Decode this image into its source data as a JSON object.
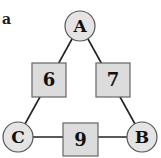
{
  "panel_label": "a",
  "colors": {
    "node_fill": "#e4e4e4",
    "node_stroke": "#555555",
    "box_fill": "#dcdcdc",
    "box_stroke": "#666666",
    "edge": "#222222",
    "text": "#111111"
  },
  "nodes": [
    {
      "id": "A",
      "label": "A",
      "cx": 80,
      "cy": 26,
      "r": 15
    },
    {
      "id": "B",
      "label": "B",
      "cx": 142,
      "cy": 137,
      "r": 15
    },
    {
      "id": "C",
      "label": "C",
      "cx": 18,
      "cy": 137,
      "r": 15
    }
  ],
  "edges": [
    {
      "from": "A",
      "to": "C",
      "label": "6",
      "box": {
        "x": 32,
        "y": 63,
        "w": 34,
        "h": 34
      }
    },
    {
      "from": "A",
      "to": "B",
      "label": "7",
      "box": {
        "x": 96,
        "y": 63,
        "w": 34,
        "h": 34
      }
    },
    {
      "from": "C",
      "to": "B",
      "label": "9",
      "box": {
        "x": 63,
        "y": 123,
        "w": 35,
        "h": 33
      }
    }
  ]
}
